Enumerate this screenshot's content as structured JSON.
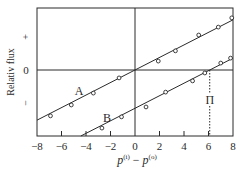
{
  "chart_data": {
    "type": "line",
    "title": "",
    "xlabel": "p(i) − p(o)",
    "xlabel_parts": {
      "p1": "p",
      "sup1": "(i)",
      "minus": "−",
      "p2": "p",
      "sup2": "(o)"
    },
    "ylabel": "Relativ flux",
    "xlim": [
      -8,
      8
    ],
    "ylim": [
      -2,
      2
    ],
    "x_ticks": [
      -8,
      -6,
      -4,
      -2,
      0,
      2,
      4,
      6,
      8
    ],
    "x_tick_labels": [
      "−8",
      "−6",
      "−4",
      "−2",
      "0",
      "2",
      "4",
      "6",
      "8"
    ],
    "y_tick_labels": [
      "+",
      "0",
      "−"
    ],
    "y_tick_values": [
      1,
      0,
      -1
    ],
    "grid": false,
    "reference_lines": {
      "horizontal_zero": true,
      "vertical_zero": true
    },
    "series": [
      {
        "name": "A",
        "label": "A",
        "fit": {
          "slope": 0.19,
          "intercept": 0.0
        },
        "x": [
          -6.9,
          -5.2,
          -3.4,
          -1.3,
          1.9,
          3.3,
          5.2,
          6.8,
          7.9
        ],
        "y": [
          -1.39,
          -1.06,
          -0.7,
          -0.24,
          0.27,
          0.58,
          1.06,
          1.3,
          1.58
        ]
      },
      {
        "name": "B",
        "label": "B",
        "fit": {
          "slope": 0.19,
          "intercept": -1.16
        },
        "x": [
          -2.7,
          -1.1,
          0.9,
          2.5,
          4.7,
          5.7,
          7.0,
          7.8
        ],
        "y": [
          -1.76,
          -1.42,
          -1.12,
          -0.67,
          -0.33,
          -0.09,
          0.21,
          0.36
        ]
      }
    ],
    "annotations": [
      {
        "text": "Π",
        "x": 6.1,
        "y": -0.85,
        "note": "dotted vertical from B zero-crossing to x-axis"
      }
    ]
  }
}
